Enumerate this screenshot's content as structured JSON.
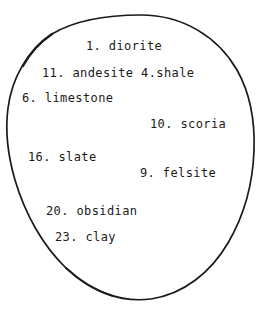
{
  "diagram": {
    "type": "oval-grouping-diagram",
    "shape_name": "hand-drawn-oval",
    "background_color": "#ffffff",
    "ink_color": "#1a1a1a",
    "stroke_width": 1.6,
    "bounds": {
      "left": 6,
      "top": 15,
      "right": 254,
      "bottom": 300
    },
    "items": [
      {
        "number": "1.",
        "name": "diorite",
        "text": "1. diorite",
        "x": 86,
        "y": 40
      },
      {
        "number": "11.",
        "name": "andesite",
        "text": "11. andesite 4.shale",
        "x": 42,
        "y": 67
      },
      {
        "number": "6.",
        "name": "limestone",
        "text": "6. limestone",
        "x": 22,
        "y": 92
      },
      {
        "number": "10.",
        "name": "scoria",
        "text": "10. scoria",
        "x": 150,
        "y": 118
      },
      {
        "number": "16.",
        "name": "slate",
        "text": "16. slate",
        "x": 28,
        "y": 151
      },
      {
        "number": "9.",
        "name": "felsite",
        "text": "9. felsite",
        "x": 140,
        "y": 167
      },
      {
        "number": "20.",
        "name": "obsidian",
        "text": "20. obsidian",
        "x": 46,
        "y": 205
      },
      {
        "number": "23.",
        "name": "clay",
        "text": "23. clay",
        "x": 55,
        "y": 231
      }
    ]
  }
}
